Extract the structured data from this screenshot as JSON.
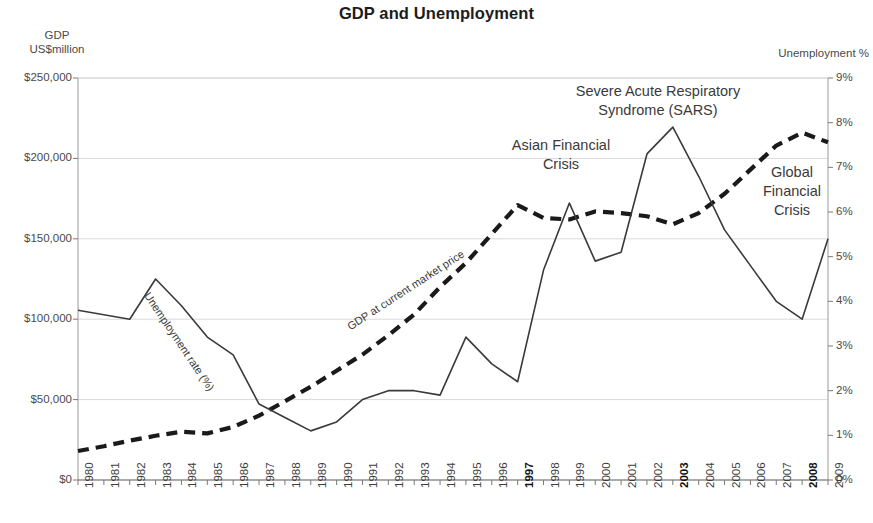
{
  "header": {
    "title": "GDP and Unemployment"
  },
  "axes": {
    "left_caption": "GDP\nUS$million",
    "right_caption": "Unemployment %"
  },
  "annotations": {
    "sars": "Severe Acute Respiratory\nSyndrome (SARS)",
    "asian_financial_crisis": "Asian Financial\nCrisis",
    "global_financial_crisis": "Global\nFinancial\nCrisis",
    "unemployment_series_label": "Unemployment rate (%)",
    "gdp_series_label": "GDP at current market price"
  },
  "chart_data": {
    "type": "line",
    "title": "GDP and Unemployment",
    "xlabel": "",
    "grid": true,
    "legend_position": "inline-labels",
    "categories": [
      "1980",
      "1981",
      "1982",
      "1983",
      "1984",
      "1985",
      "1986",
      "1987",
      "1988",
      "1989",
      "1990",
      "1991",
      "1992",
      "1993",
      "1994",
      "1995",
      "1996",
      "1997",
      "1998",
      "1999",
      "2000",
      "2001",
      "2002",
      "2003",
      "2004",
      "2005",
      "2006",
      "2007",
      "2008",
      "2009"
    ],
    "bold_categories": [
      "1997",
      "2003",
      "2008"
    ],
    "axis_left": {
      "label": "GDP US$million",
      "ylim": [
        0,
        250000
      ],
      "tick_values": [
        0,
        50000,
        100000,
        150000,
        200000,
        250000
      ],
      "tick_labels": [
        "$0",
        "$50,000",
        "$100,000",
        "$150,000",
        "$200,000",
        "$250,000"
      ]
    },
    "axis_right": {
      "label": "Unemployment %",
      "ylim": [
        0,
        9
      ],
      "tick_values": [
        0,
        1,
        2,
        3,
        4,
        5,
        6,
        7,
        8,
        9
      ],
      "tick_labels": [
        "0%",
        "1%",
        "2%",
        "3%",
        "4%",
        "5%",
        "6%",
        "7%",
        "8%",
        "9%"
      ]
    },
    "series": [
      {
        "name": "GDP at current market price",
        "axis": "left",
        "style": "dashed",
        "color": "#1a1a1a",
        "units": "US$million",
        "values": [
          18000,
          21000,
          24500,
          27500,
          30000,
          29000,
          33000,
          40000,
          49000,
          58000,
          68000,
          78000,
          90000,
          103000,
          120000,
          135000,
          153000,
          171000,
          163000,
          162000,
          167000,
          166000,
          164000,
          159000,
          166000,
          178000,
          193000,
          208000,
          216000,
          210000
        ]
      },
      {
        "name": "Unemployment rate (%)",
        "axis": "right",
        "style": "solid",
        "color": "#3a3a3a",
        "units": "%",
        "values": [
          3.8,
          3.7,
          3.6,
          4.5,
          3.9,
          3.2,
          2.8,
          1.7,
          1.4,
          1.1,
          1.3,
          1.8,
          2.0,
          2.0,
          1.9,
          3.2,
          2.6,
          2.2,
          4.7,
          6.2,
          4.9,
          5.1,
          7.3,
          7.9,
          6.8,
          5.6,
          4.8,
          4.0,
          3.6,
          5.4
        ]
      }
    ]
  }
}
